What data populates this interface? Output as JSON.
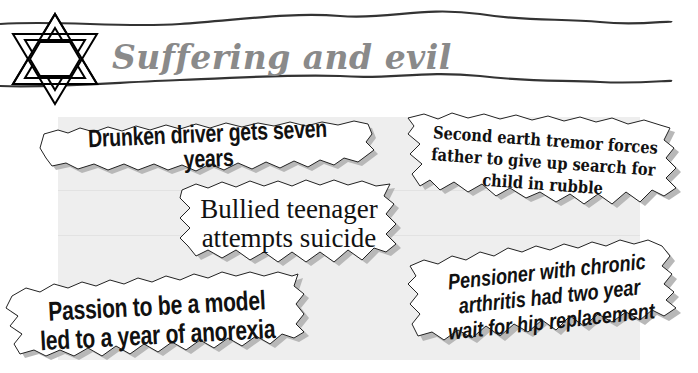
{
  "header": {
    "title": "Suffering and evil",
    "icon": "star-of-david-icon",
    "title_color": "#8a8a8a"
  },
  "panel": {
    "background": "#eeeeee"
  },
  "headlines": [
    {
      "id": "drunken-driver",
      "lines": [
        "Drunken driver gets seven years"
      ],
      "style": "condensed-bold"
    },
    {
      "id": "earth-tremor",
      "lines": [
        "Second earth tremor forces",
        "father to give up search for",
        "child in rubble"
      ],
      "style": "serif-bold"
    },
    {
      "id": "bullied-teenager",
      "lines": [
        "Bullied teenager",
        "attempts suicide"
      ],
      "style": "serif"
    },
    {
      "id": "pensioner",
      "lines": [
        "Pensioner with chronic",
        "arthritis had two year",
        "wait for hip replacement"
      ],
      "style": "italic-bold"
    },
    {
      "id": "model-anorexia",
      "lines": [
        "Passion to be a model",
        "led to a year of anorexia"
      ],
      "style": "condensed-bold"
    }
  ]
}
